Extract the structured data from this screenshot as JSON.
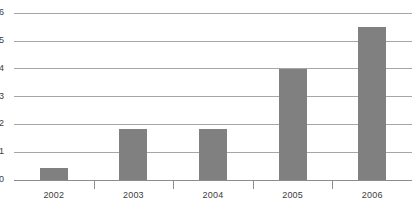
{
  "chart_data": {
    "type": "bar",
    "title": "",
    "subtitle": "",
    "xlabel": "",
    "ylabel": "",
    "categories": [
      "2002",
      "2003",
      "2004",
      "2005",
      "2006"
    ],
    "values": [
      0.43,
      1.85,
      1.85,
      4.0,
      5.5
    ],
    "series": [
      {
        "name": "",
        "values": [
          0.43,
          1.85,
          1.85,
          4.0,
          5.5
        ]
      }
    ],
    "ylim": [
      0,
      6
    ],
    "ytick_labels": [
      "0",
      "1",
      "2",
      "3",
      "4",
      "5",
      "6"
    ],
    "ytick_values": [
      0,
      1,
      2,
      3,
      4,
      5,
      6
    ],
    "grid": true,
    "grid_axis": "y",
    "legend": false,
    "legend_position": "none",
    "annotations": [],
    "colors": {
      "bar": "#808080",
      "gridline": "#a6a6a6",
      "axis": "#8c8c8c",
      "tick_label": "#3d3d3d",
      "background": "#ffffff"
    }
  }
}
